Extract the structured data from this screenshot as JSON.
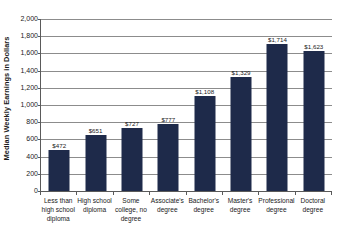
{
  "chart_data": {
    "type": "bar",
    "title": "",
    "xlabel": "",
    "ylabel": "Median Weekly Earnings in Dollars",
    "ylim": [
      0,
      2000
    ],
    "ytick_step": 200,
    "grid": true,
    "legend": "none",
    "bar_color": "#1e2a4a",
    "categories": [
      "Less than high school diploma",
      "High school diploma",
      "Some college, no degree",
      "Associate's degree",
      "Bachelor's degree",
      "Master's degree",
      "Professional degree",
      "Doctoral degree"
    ],
    "values": [
      472,
      651,
      727,
      777,
      1108,
      1329,
      1714,
      1623
    ],
    "value_labels": [
      "$472",
      "$651",
      "$727",
      "$777",
      "$1,108",
      "$1,329",
      "$1,714",
      "$1,623"
    ],
    "ytick_labels": [
      "2,000",
      "1,800",
      "1,600",
      "1,400",
      "1,200",
      "1,000",
      "800",
      "600",
      "400",
      "200",
      "0"
    ],
    "ytick_values": [
      2000,
      1800,
      1600,
      1400,
      1200,
      1000,
      800,
      600,
      400,
      200,
      0
    ]
  }
}
